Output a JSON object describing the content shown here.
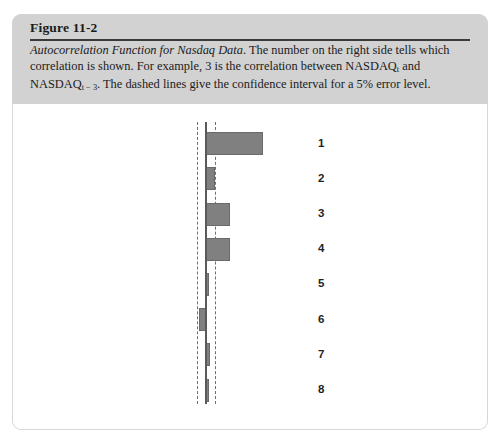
{
  "figure": {
    "number": "Figure 11-2",
    "caption_title": "Autocorrelation Function for Nasdaq Data",
    "caption_rest_1": ". The number on the right side tells which correlation is shown. For example, 3 is the correlation between NASDAQ",
    "caption_sub_1": "t",
    "caption_rest_2": " and NASDAQ",
    "caption_sub_2": "t − 3",
    "caption_rest_3": ". The dashed lines give the confidence interval for a 5% error level."
  },
  "colors": {
    "caption_band": "#d2d2d2",
    "bar_fill": "#808080",
    "bar_stroke": "#6a6a6a",
    "axis": "#5a5a5a",
    "confidence_line": "#6f6f6f",
    "panel_background": "#ffffff",
    "panel_border": "#d8d8d8",
    "text": "#1b1b1b"
  },
  "chart_data": {
    "type": "bar",
    "orientation": "horizontal",
    "title": "Autocorrelation Function for Nasdaq Data",
    "xlabel": "",
    "ylabel": "Lag",
    "categories": [
      "1",
      "2",
      "3",
      "4",
      "5",
      "6",
      "7",
      "8"
    ],
    "values": [
      0.78,
      0.12,
      0.33,
      0.33,
      0.04,
      -0.09,
      0.05,
      0.04
    ],
    "xlim": [
      -1,
      1
    ],
    "grid": false,
    "legend": null,
    "annotations": [
      "Dashed lines give the 5% error level confidence interval"
    ],
    "confidence_interval": {
      "lower": -0.13,
      "upper": 0.13,
      "style": "dashed",
      "error_level": "5%"
    },
    "zero_line": 0
  }
}
